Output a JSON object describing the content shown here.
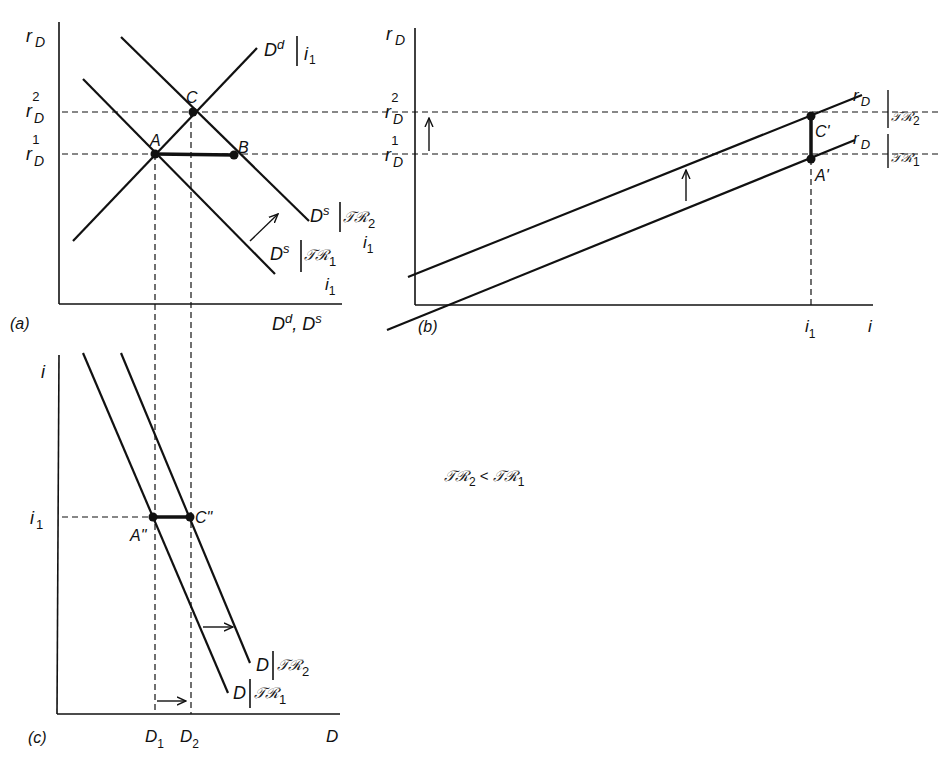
{
  "panels": {
    "a": {
      "tag": "(a)",
      "y_axis": "r",
      "y_axis_sub": "D",
      "x_axis": "D",
      "x_axis_sup1": "d",
      "x_axis_sep": ", D",
      "x_axis_sup2": "s",
      "tick_r2": "r",
      "tick_r2_sub": "D",
      "tick_r2_sup": "2",
      "tick_r1": "r",
      "tick_r1_sub": "D",
      "tick_r1_sup": "1",
      "points": {
        "A": "A",
        "B": "B",
        "C": "C"
      },
      "curves": {
        "demand": {
          "main": "D",
          "sup": "d",
          "cond": "i",
          "cond_sub": "1"
        },
        "supply2": {
          "main": "D",
          "sup": "s",
          "cond": "𝒯ℛ",
          "cond_sub": "2",
          "extra": "i",
          "extra_sub": "1"
        },
        "supply1": {
          "main": "D",
          "sup": "s",
          "cond": "𝒯ℛ",
          "cond_sub": "1",
          "extra": "i",
          "extra_sub": "1"
        }
      }
    },
    "b": {
      "tag": "(b)",
      "y_axis": "r",
      "y_axis_sub": "D",
      "x_axis": "i",
      "tick_i1": "i",
      "tick_i1_sub": "1",
      "tick_r2": "r",
      "tick_r2_sub": "D",
      "tick_r2_sup": "2",
      "tick_r1": "r",
      "tick_r1_sub": "D",
      "tick_r1_sup": "1",
      "points": {
        "C": "C'",
        "A": "A'"
      },
      "curves": {
        "upper": {
          "main": "r",
          "sub": "D",
          "cond": "𝒯ℛ",
          "cond_sub": "2"
        },
        "lower": {
          "main": "r",
          "sub": "D",
          "cond": "𝒯ℛ",
          "cond_sub": "1"
        }
      }
    },
    "c": {
      "tag": "(c)",
      "y_axis": "i",
      "x_axis": "D",
      "tick_i1": "i",
      "tick_i1_sub": "1",
      "tick_D1": "D",
      "tick_D1_sub": "1",
      "tick_D2": "D",
      "tick_D2_sub": "2",
      "points": {
        "A": "A\"",
        "C": "C\""
      },
      "curves": {
        "d2": {
          "main": "D",
          "cond": "𝒯ℛ",
          "cond_sub": "2"
        },
        "d1": {
          "main": "D",
          "cond": "𝒯ℛ",
          "cond_sub": "1"
        }
      }
    }
  },
  "annotation": {
    "left": "𝒯ℛ",
    "left_sub": "2",
    "op": " < ",
    "right": "𝒯ℛ",
    "right_sub": "1"
  }
}
